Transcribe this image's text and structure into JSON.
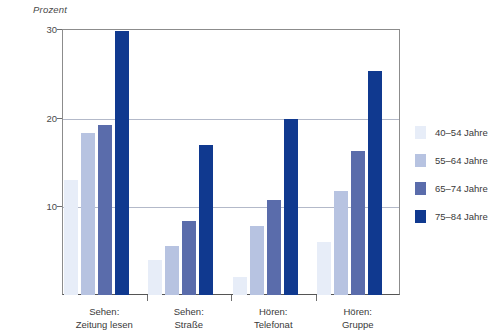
{
  "chart_data": {
    "type": "bar",
    "title": "",
    "subtitle": "",
    "xlabel": "",
    "ylabel": "Prozent",
    "ylim": [
      0,
      30
    ],
    "yticks": [
      10,
      20,
      30
    ],
    "grid": true,
    "legend_position": "right",
    "categories": [
      "Sehen: Zeitung lesen",
      "Sehen: Straße",
      "Hören: Telefonat",
      "Hören: Gruppe"
    ],
    "category_lines": [
      [
        "Sehen:",
        "Zeitung lesen"
      ],
      [
        "Sehen:",
        "Straße"
      ],
      [
        "Hören:",
        "Telefonat"
      ],
      [
        "Hören:",
        "Gruppe"
      ]
    ],
    "series": [
      {
        "name": "40–54 Jahre",
        "color": "#e7edf8",
        "values": [
          13.0,
          4.0,
          2.0,
          6.0
        ]
      },
      {
        "name": "55–64 Jahre",
        "color": "#b7c3e1",
        "values": [
          18.3,
          5.5,
          7.8,
          11.7
        ]
      },
      {
        "name": "65–74 Jahre",
        "color": "#5a6cab",
        "values": [
          19.2,
          8.4,
          10.7,
          16.2
        ]
      },
      {
        "name": "75–84 Jahre",
        "color": "#10398f",
        "values": [
          29.8,
          16.9,
          19.8,
          25.3
        ]
      }
    ]
  },
  "axis": {
    "unit_label": "Prozent",
    "ytick_labels": [
      "10",
      "20",
      "30"
    ]
  },
  "legend": {
    "items": [
      {
        "label": "40–54 Jahre"
      },
      {
        "label": "55–64 Jahre"
      },
      {
        "label": "65–74 Jahre"
      },
      {
        "label": "75–84 Jahre"
      }
    ]
  }
}
